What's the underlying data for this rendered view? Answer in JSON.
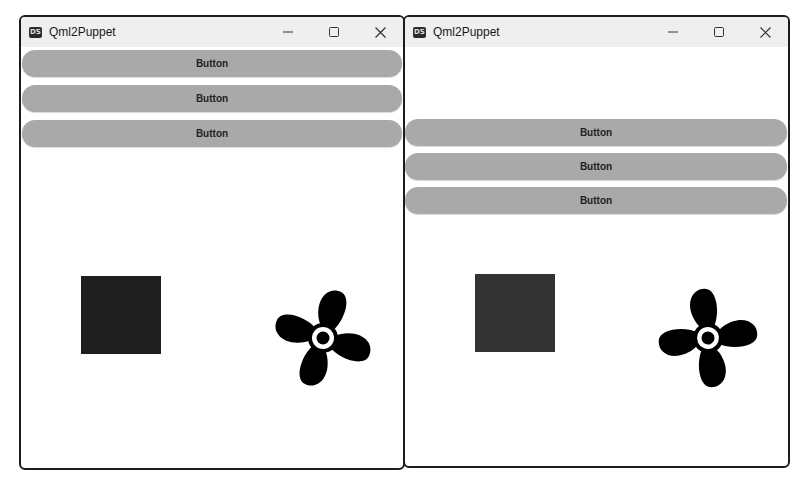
{
  "windows": [
    {
      "title": "Qml2Puppet",
      "app_icon": "DS",
      "controls": {
        "minimize": "minimize-icon",
        "maximize": "maximize-icon",
        "close": "close-icon"
      },
      "buttons": [
        {
          "label": "Button"
        },
        {
          "label": "Button"
        },
        {
          "label": "Button"
        }
      ],
      "square_color": "#1e1e1e",
      "fan_icon": "fan-icon"
    },
    {
      "title": "Qml2Puppet",
      "app_icon": "DS",
      "controls": {
        "minimize": "minimize-icon",
        "maximize": "maximize-icon",
        "close": "close-icon"
      },
      "buttons": [
        {
          "label": "Button"
        },
        {
          "label": "Button"
        },
        {
          "label": "Button"
        }
      ],
      "square_color": "#333333",
      "fan_icon": "fan-icon"
    }
  ],
  "colors": {
    "button_bg": "#a9a9a9",
    "titlebar_bg": "#efefef",
    "window_border": "#1c1c1c"
  }
}
